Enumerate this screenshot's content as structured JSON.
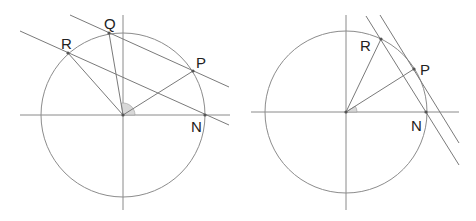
{
  "diagrams": [
    {
      "id": "left",
      "center": [
        123,
        115
      ],
      "radius": 82,
      "points": {
        "P": {
          "label": "P",
          "x": 193,
          "y": 71
        },
        "Q": {
          "label": "Q",
          "x": 109,
          "y": 33
        },
        "R": {
          "label": "R",
          "x": 68,
          "y": 53
        },
        "N": {
          "label": "N",
          "x": 205,
          "y": 115
        }
      },
      "lines": [
        {
          "name": "line-RN",
          "through": [
            "R",
            "N"
          ]
        },
        {
          "name": "line-QP",
          "through": [
            "Q",
            "P"
          ]
        }
      ],
      "radii": [
        "P",
        "Q",
        "R"
      ]
    },
    {
      "id": "right",
      "center": [
        346,
        112
      ],
      "radius": 81,
      "points": {
        "P": {
          "label": "P",
          "x": 414,
          "y": 69
        },
        "R": {
          "label": "R",
          "x": 381,
          "y": 39
        },
        "N": {
          "label": "N",
          "x": 426,
          "y": 112
        }
      },
      "lines": [
        {
          "name": "line-RN",
          "through": [
            "R",
            "N"
          ]
        },
        {
          "name": "tangent-at-P",
          "through": [
            "P"
          ]
        }
      ],
      "radii": [
        "P",
        "R"
      ]
    }
  ],
  "labels": {
    "left_P": "P",
    "left_Q": "Q",
    "left_R": "R",
    "left_N": "N",
    "right_P": "P",
    "right_R": "R",
    "right_N": "N"
  },
  "colors": {
    "line": "#7a7a7a",
    "circle": "#8c8c8c",
    "angle_fill": "#d8d8d8",
    "text": "#222222"
  }
}
